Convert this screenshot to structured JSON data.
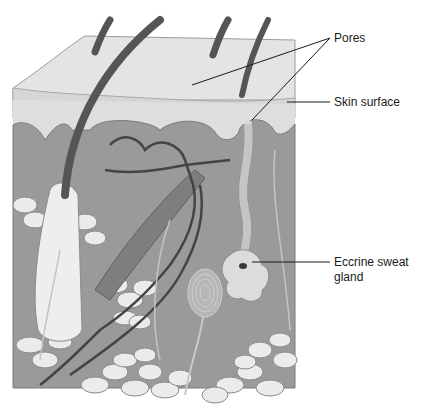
{
  "diagram": {
    "labels": {
      "pores": "Pores",
      "skin_surface": "Skin surface",
      "eccrine_line1": "Eccrine sweat",
      "eccrine_line2": "gland"
    },
    "colors": {
      "background": "#ffffff",
      "epidermis_top": "#e6e6e6",
      "epidermis_layer": "#dcdcdc",
      "dermis": "#9a9a9a",
      "fat_cells": "#e8e8e8",
      "hair": "#555555",
      "vessel": "#4a4a4a",
      "gland": "#d9d9d9",
      "leader_line": "#1a1a1a"
    }
  }
}
